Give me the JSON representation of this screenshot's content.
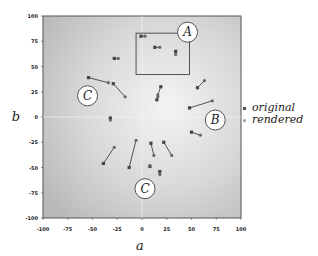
{
  "chart_data": {
    "type": "scatter",
    "title": "",
    "xlabel": "a",
    "ylabel": "b",
    "xlim": [
      -100,
      100
    ],
    "ylim": [
      -100,
      100
    ],
    "xticks": [
      "-100",
      "-75",
      "-50",
      "-25",
      "0",
      "25",
      "50",
      "75",
      "100"
    ],
    "yticks": [
      "100",
      "75",
      "50",
      "25",
      "0",
      "-25",
      "-50",
      "-75",
      "-100"
    ],
    "grid": "zero lines only",
    "legend": {
      "position": "right",
      "entries": [
        {
          "label": "original",
          "color": "#555555"
        },
        {
          "label": "rendered",
          "color": "#999999"
        }
      ]
    },
    "pairs": [
      {
        "original": [
          -1,
          80
        ],
        "rendered": [
          3,
          80
        ]
      },
      {
        "original": [
          13,
          69
        ],
        "rendered": [
          18,
          69
        ]
      },
      {
        "original": [
          34,
          65
        ],
        "rendered": [
          34,
          62
        ]
      },
      {
        "original": [
          -28,
          58
        ],
        "rendered": [
          -24,
          58
        ]
      },
      {
        "original": [
          -54,
          39
        ],
        "rendered": [
          -34,
          34
        ]
      },
      {
        "original": [
          -29,
          33
        ],
        "rendered": [
          -17,
          20
        ]
      },
      {
        "original": [
          -32,
          -1
        ],
        "rendered": [
          -32,
          -3
        ]
      },
      {
        "original": [
          19,
          30
        ],
        "rendered": [
          16,
          22
        ]
      },
      {
        "original": [
          15,
          17
        ],
        "rendered": [
          16,
          20
        ]
      },
      {
        "original": [
          56,
          29
        ],
        "rendered": [
          63,
          36
        ]
      },
      {
        "original": [
          48,
          9
        ],
        "rendered": [
          71,
          16
        ]
      },
      {
        "original": [
          50,
          -15
        ],
        "rendered": [
          59,
          -18
        ]
      },
      {
        "original": [
          -39,
          -46
        ],
        "rendered": [
          -28,
          -30
        ]
      },
      {
        "original": [
          -13,
          -50
        ],
        "rendered": [
          -6,
          -23
        ]
      },
      {
        "original": [
          9,
          -26
        ],
        "rendered": [
          12,
          -38
        ]
      },
      {
        "original": [
          22,
          -25
        ],
        "rendered": [
          30,
          -38
        ]
      },
      {
        "original": [
          8,
          -49
        ],
        "rendered": [
          8,
          -48
        ]
      },
      {
        "original": [
          18,
          -54
        ],
        "rendered": [
          18,
          -57
        ]
      }
    ],
    "annotations": [
      {
        "label": "A",
        "type": "circle-label",
        "at": [
          46,
          84
        ]
      },
      {
        "label": "B",
        "type": "circle-label",
        "at": [
          74,
          -3
        ]
      },
      {
        "label": "C",
        "type": "circle-label",
        "at": [
          -55,
          21
        ]
      },
      {
        "label": "C",
        "type": "circle-label",
        "at": [
          3,
          -71
        ]
      },
      {
        "label": "",
        "type": "rect",
        "from": [
          -6,
          83
        ],
        "to": [
          48,
          42
        ]
      }
    ]
  }
}
